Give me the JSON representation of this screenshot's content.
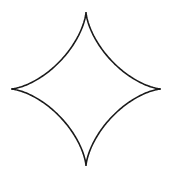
{
  "figure": {
    "shape": "astroid",
    "center": [
      86,
      89
    ],
    "radius_x": 75,
    "radius_y": 77,
    "stroke_color": "#1a1a1a",
    "stroke_width": 1.6,
    "fill_color": "#ffffff",
    "cusps": {
      "top": [
        86,
        12
      ],
      "right": [
        161,
        89
      ],
      "bottom": [
        86,
        166
      ],
      "left": [
        11,
        89
      ]
    }
  }
}
